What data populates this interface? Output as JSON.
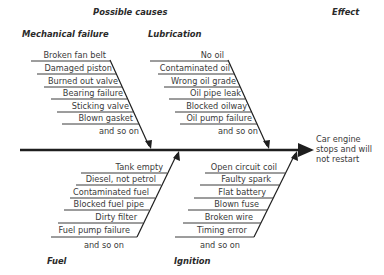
{
  "header": {
    "causes_title": "Possible causes",
    "effect_title": "Effect"
  },
  "effect": {
    "lines": [
      "Car engine",
      "stops and will",
      "not restart"
    ]
  },
  "categories": {
    "mechanical": {
      "title": "Mechanical failure",
      "items": [
        "Broken fan belt",
        "Damaged piston",
        "Burned out valve",
        "Bearing failure",
        "Sticking valve",
        "Blown gasket",
        "and so on"
      ]
    },
    "lubrication": {
      "title": "Lubrication",
      "items": [
        "No oil",
        "Contaminated oil",
        "Wrong oil grade",
        "Oil pipe leak",
        "Blocked oilway",
        "Oil pump failure",
        "and so on"
      ]
    },
    "fuel": {
      "title": "Fuel",
      "items": [
        "Tank empty",
        "Diesel, not petrol",
        "Contaminated fuel",
        "Blocked fuel pipe",
        "Dirty filter",
        "Fuel pump failure",
        "and so on"
      ]
    },
    "ignition": {
      "title": "Ignition",
      "items": [
        "Open circuit coil",
        "Faulty spark",
        "Flat battery",
        "Blown fuse",
        "Broken wire",
        "Timing error",
        "and so on"
      ]
    }
  },
  "colors": {
    "line": "#1e1e1e",
    "text": "#3a3a3a",
    "background": "#ffffff"
  }
}
